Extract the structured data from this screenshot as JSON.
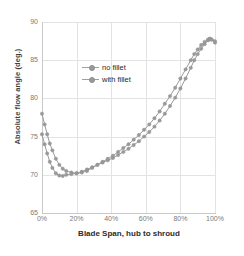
{
  "chart_data": {
    "type": "line",
    "title": "",
    "xlabel": "Blade Span, hub to shroud",
    "ylabel": "Absolute flow angle (deg.)",
    "xlim": [
      0,
      100
    ],
    "ylim": [
      65,
      90
    ],
    "xticks": [
      "0%",
      "20%",
      "40%",
      "60%",
      "80%",
      "100%"
    ],
    "xtick_values": [
      0,
      20,
      40,
      60,
      80,
      100
    ],
    "yticks": [
      "65",
      "70",
      "75",
      "80",
      "85",
      "90"
    ],
    "ytick_values": [
      65,
      70,
      75,
      80,
      85,
      90
    ],
    "grid": true,
    "legend_position": "upper-left-inside",
    "series": [
      {
        "name": "no fillet",
        "color": "#9a9a9a",
        "marker": "circle",
        "x": [
          0,
          1.5,
          3,
          4.5,
          6,
          8,
          10,
          12,
          14,
          17,
          20,
          23,
          26,
          29,
          32,
          35,
          38,
          41,
          44,
          47,
          50,
          53,
          56,
          59,
          62,
          65,
          68,
          71,
          74,
          77,
          80,
          83,
          86,
          88,
          90,
          92,
          94,
          96,
          97,
          98,
          100
        ],
        "y": [
          78.0,
          76.6,
          75.3,
          74.1,
          73.2,
          72.1,
          71.3,
          70.8,
          70.5,
          70.3,
          70.2,
          70.4,
          70.7,
          71.0,
          71.3,
          71.6,
          71.9,
          72.2,
          72.6,
          73.0,
          73.4,
          73.9,
          74.4,
          75.0,
          75.6,
          76.3,
          77.1,
          78.0,
          79.0,
          80.1,
          81.3,
          82.6,
          84.0,
          85.0,
          85.8,
          86.5,
          87.1,
          87.6,
          87.8,
          87.7,
          87.3
        ]
      },
      {
        "name": "with fillet",
        "color": "#9a9a9a",
        "marker": "circle",
        "x": [
          0,
          1.5,
          3,
          4.5,
          6,
          8,
          10,
          12,
          14,
          17,
          20,
          23,
          26,
          29,
          32,
          35,
          38,
          41,
          44,
          47,
          50,
          53,
          56,
          59,
          62,
          65,
          68,
          71,
          74,
          77,
          80,
          83,
          86,
          88,
          90,
          92,
          94,
          96,
          97,
          98,
          100
        ],
        "y": [
          75.3,
          74.0,
          72.8,
          71.7,
          70.9,
          70.2,
          69.9,
          69.85,
          70.0,
          70.1,
          70.2,
          70.3,
          70.5,
          70.9,
          71.3,
          71.7,
          72.1,
          72.5,
          73.0,
          73.5,
          74.0,
          74.6,
          75.2,
          75.9,
          76.6,
          77.4,
          78.3,
          79.3,
          80.3,
          81.4,
          82.6,
          83.8,
          85.0,
          85.8,
          86.4,
          87.0,
          87.4,
          87.7,
          87.8,
          87.7,
          87.5
        ]
      }
    ]
  },
  "legend": {
    "entries": [
      {
        "label": "no fillet"
      },
      {
        "label": "with fillet"
      }
    ]
  },
  "colors": {
    "series": "#9a9a9a",
    "grid": "#e3e3e3",
    "axis_text": "#7a7a7a",
    "title_text": "#2b2b2b",
    "background": "#ffffff"
  }
}
